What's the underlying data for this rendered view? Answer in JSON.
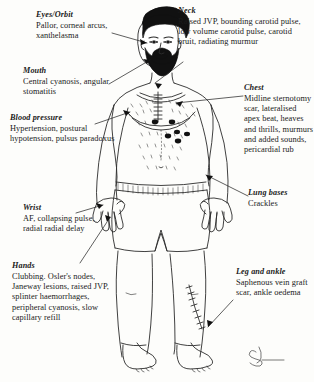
{
  "figure": {
    "signature": "artist-monogram"
  },
  "annotations": [
    {
      "id": "eyes",
      "heading": "Eyes/Orbit",
      "body": "Pallor, corneal arcus, xanthelasma",
      "target": "eyes"
    },
    {
      "id": "mouth",
      "heading": "Mouth",
      "body": "Central cyanosis, angular stomatitis",
      "target": "mouth"
    },
    {
      "id": "blood-pressure",
      "heading": "Blood pressure",
      "body": "Hypertension, postural hypotension, pulsus paradoxus",
      "target": "upper-arm"
    },
    {
      "id": "wrist",
      "heading": "Wrist",
      "body": "AF, collapsing pulse, radial radial delay",
      "target": "wrist"
    },
    {
      "id": "hands",
      "heading": "Hands",
      "body": "Clubbing. Osler's nodes, Janeway lesions, raised JVP, splinter haemorrhages, peripheral cyanosis, slow capillary refill",
      "target": "hand"
    },
    {
      "id": "neck",
      "heading": "Neck",
      "body": "Raised JVP, bounding carotid pulse, low volume carotid pulse, carotid bruit, radiating murmur",
      "target": "neck"
    },
    {
      "id": "chest",
      "heading": "Chest",
      "body": "Midline sternotomy scar, lateralised apex beat, heaves and thrills, murmurs and added sounds, pericardial rub",
      "target": "chest"
    },
    {
      "id": "lung-bases",
      "heading": "Lung bases",
      "body": "Crackles",
      "target": "lung-bases"
    },
    {
      "id": "leg-ankle",
      "heading": "Leg and ankle",
      "body": "Saphenous vein graft scar, ankle oedema",
      "target": "ankle"
    }
  ],
  "colors": {
    "background": "#fdfdfb",
    "ink": "#1a1a1a",
    "line": "#2b2b2b",
    "hair": "#111111",
    "skin": "#ffffff"
  }
}
